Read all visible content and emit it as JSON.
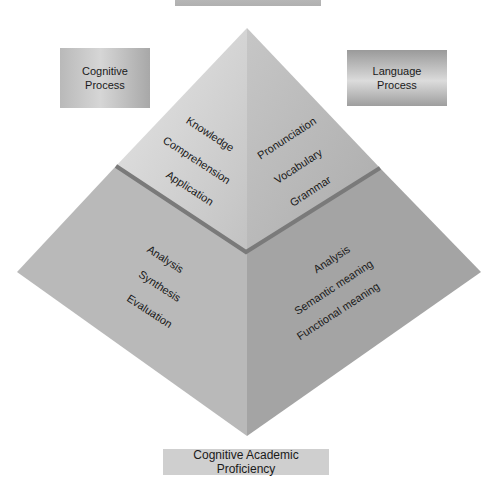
{
  "diagram": {
    "type": "pyramid",
    "top_label": "",
    "left_box": {
      "line1": "Cognitive",
      "line2": "Process"
    },
    "right_box": {
      "line1": "Language",
      "line2": "Process"
    },
    "bottom_box": "Cognitive Academic Proficiency",
    "upper_left_face": [
      "Knowledge",
      "Comprehension",
      "Application"
    ],
    "upper_right_face": [
      "Pronunciation",
      "Vocabulary",
      "Grammar"
    ],
    "lower_left_face": [
      "Analysis",
      "Synthesis",
      "Evaluation"
    ],
    "lower_right_face": [
      "Analysis",
      "Semantic meaning",
      "Functional meaning"
    ],
    "colors": {
      "upper_left": "#c8c8c8",
      "upper_right": "#b4b4b4",
      "lower_left": "#b9b9b9",
      "lower_right": "#a3a3a3",
      "divider": "#7a7a7a"
    }
  }
}
